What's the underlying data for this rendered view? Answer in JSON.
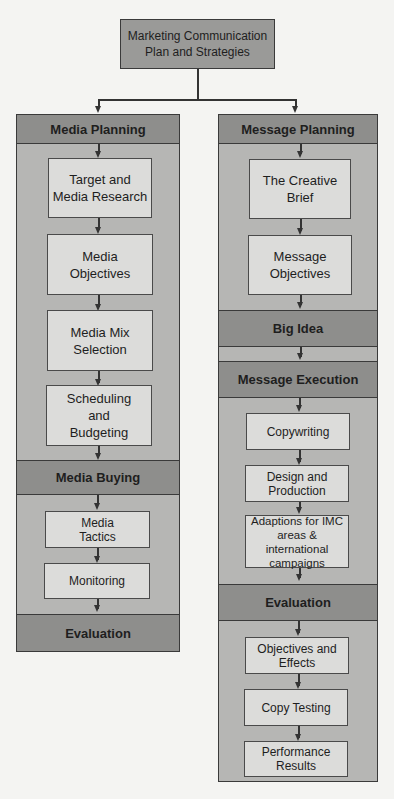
{
  "title": "Marketing Communication Plan and Strategies",
  "title_lines": [
    "Marketing Communication",
    "Plan and Strategies"
  ],
  "colors": {
    "background": "#f4f4f2",
    "panel": "#b6b6b4",
    "band": "#8e8e8c",
    "box": "#dcdcda",
    "top_box": "#9a9a98",
    "line": "#333333"
  },
  "left_column": {
    "header": "Media Planning",
    "planning_steps": [
      {
        "lines": [
          "Target and",
          "Media Research"
        ]
      },
      {
        "lines": [
          "Media",
          "Objectives"
        ]
      },
      {
        "lines": [
          "Media Mix",
          "Selection"
        ]
      },
      {
        "lines": [
          "Scheduling",
          "and",
          "Budgeting"
        ]
      }
    ],
    "buying_header": "Media Buying",
    "buying_steps": [
      {
        "lines": [
          "Media",
          "Tactics"
        ]
      },
      {
        "lines": [
          "Monitoring"
        ]
      }
    ],
    "footer": "Evaluation"
  },
  "right_column": {
    "header": "Message Planning",
    "planning_steps": [
      {
        "lines": [
          "The Creative",
          "Brief"
        ]
      },
      {
        "lines": [
          "Message",
          "Objectives"
        ]
      }
    ],
    "big_idea": "Big Idea",
    "execution_header": "Message Execution",
    "execution_steps": [
      {
        "lines": [
          "Copywriting"
        ]
      },
      {
        "lines": [
          "Design and",
          "Production"
        ]
      },
      {
        "lines": [
          "Adaptions for IMC",
          "areas & international",
          "campaigns"
        ]
      }
    ],
    "evaluation_header": "Evaluation",
    "evaluation_steps": [
      {
        "lines": [
          "Objectives and",
          "Effects"
        ]
      },
      {
        "lines": [
          "Copy Testing"
        ]
      },
      {
        "lines": [
          "Performance",
          "Results"
        ]
      }
    ]
  }
}
